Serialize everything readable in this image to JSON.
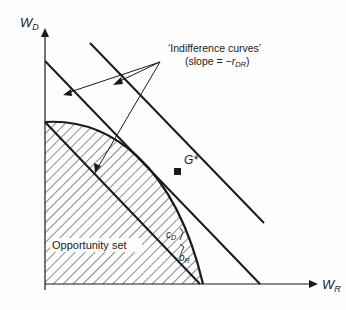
{
  "axes": {
    "y_label": "W",
    "y_sub": "D",
    "x_label": "W",
    "x_sub": "R"
  },
  "annotations": {
    "indifference_title": "‘Indifference curves’",
    "slope_prefix": "(slope = −",
    "slope_var": "r",
    "slope_sub": "DR",
    "slope_suffix": ")",
    "optimum": "G*",
    "opportunity_set": "Opportunity set",
    "c_label": "c",
    "c_sub": "D",
    "b_label": "b",
    "b_sub": "R"
  },
  "colors": {
    "ink": "#1a1a1a",
    "background": "#fefefe"
  }
}
